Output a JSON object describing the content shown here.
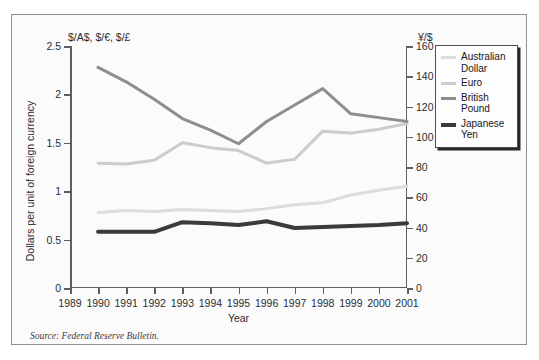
{
  "figure": {
    "left_axis_unit": "$/A$, $/€, $/£",
    "right_axis_unit": "¥/$",
    "y_axis_title": "Dollars per unit of foreign currency",
    "x_axis_title": "Year",
    "source_note": "Source: Federal Reserve Bulletin.",
    "frame_color": "#8d8f96",
    "axis_color": "#5d5f66"
  },
  "legend": {
    "position": "top-right",
    "items": [
      {
        "label": "Australian Dollar",
        "color": "#dcdcdc",
        "width": 3
      },
      {
        "label": "Euro",
        "color": "#cccccc",
        "width": 3
      },
      {
        "label": "British Pound",
        "color": "#8e8e8e",
        "width": 3
      },
      {
        "label": "Japanese Yen",
        "color": "#3a3a3a",
        "width": 4
      }
    ]
  },
  "chart_data": {
    "type": "line",
    "title": "",
    "subtitle": "",
    "xlabel": "Year",
    "ylabel": "Dollars per unit of foreign currency",
    "x": [
      1989,
      1990,
      1991,
      1992,
      1993,
      1994,
      1995,
      1996,
      1997,
      1998,
      1999,
      2000,
      2001
    ],
    "xtick_labels": [
      "1989",
      "1990",
      "1991",
      "1992",
      "1993",
      "1994",
      "1995",
      "1996",
      "1997",
      "1998",
      "1999",
      "2000",
      "2001"
    ],
    "xlim": [
      1989,
      2001
    ],
    "ylim": [
      0,
      2.5
    ],
    "ytick_labels": [
      "0",
      "0.5",
      "1",
      "1.5",
      "2",
      "2.5"
    ],
    "yticks": [
      0,
      0.5,
      1,
      1.5,
      2,
      2.5
    ],
    "y2lim": [
      0,
      160
    ],
    "y2ticks": [
      0,
      20,
      40,
      60,
      80,
      100,
      120,
      140,
      160
    ],
    "y2tick_labels": [
      "0",
      "20",
      "40",
      "60",
      "80",
      "100",
      "120",
      "140",
      "160"
    ],
    "grid": false,
    "legend_position": "top-right",
    "series": [
      {
        "name": "Australian Dollar",
        "axis": "left",
        "color": "#dcdcdc",
        "x": [
          1990,
          1991,
          1992,
          1993,
          1994,
          1995,
          1996,
          1997,
          1998,
          1999,
          2000,
          2001
        ],
        "values": [
          0.78,
          0.78,
          0.74,
          0.68,
          0.73,
          0.74,
          0.78,
          0.74,
          0.63,
          0.65,
          0.58,
          0.52
        ]
      },
      {
        "name": "Euro",
        "axis": "left",
        "color": "#cccccc",
        "x": [
          1990,
          1991,
          1992,
          1993,
          1994,
          1995,
          1996,
          1997,
          1998,
          1999,
          2000,
          2001
        ],
        "values": [
          1.29,
          1.29,
          1.32,
          1.5,
          1.43,
          1.42,
          1.29,
          1.29,
          1.44,
          1.61,
          1.57,
          1.5
        ]
      },
      {
        "name": "British Pound",
        "axis": "left",
        "color": "#8e8e8e",
        "x": [
          1990,
          1991,
          1992,
          1993,
          1994,
          1995,
          1996,
          1997,
          1998,
          1999,
          2000,
          2001
        ],
        "values": [
          2.28,
          2.13,
          1.95,
          1.75,
          1.63,
          1.49,
          1.72,
          1.89,
          2.06,
          1.8,
          1.76,
          1.72
        ]
      },
      {
        "name": "Japanese Yen",
        "axis": "right",
        "color": "#3a3a3a",
        "x": [
          1990,
          1991,
          1992,
          1993,
          1994,
          1995,
          1996,
          1997,
          1998,
          1999,
          2000,
          2001
        ],
        "values": [
          36.5,
          36.5,
          36.5,
          43.0,
          42.5,
          41.0,
          43.5,
          39.0,
          39.5,
          40.0,
          41.0,
          42.0
        ]
      }
    ],
    "series_left_rendered": [
      {
        "name": "Australian Dollar",
        "color": "#dcdcdc",
        "points": [
          [
            1990,
            0.78
          ],
          [
            1991,
            0.8
          ],
          [
            1992,
            0.79
          ],
          [
            1993,
            0.81
          ],
          [
            1994,
            0.8
          ],
          [
            1995,
            0.79
          ],
          [
            1996,
            0.82
          ],
          [
            1997,
            0.86
          ],
          [
            1998,
            0.88
          ],
          [
            1999,
            0.96
          ],
          [
            2000,
            1.01
          ],
          [
            2001,
            1.05
          ]
        ]
      },
      {
        "name": "Euro",
        "color": "#cccccc",
        "points": [
          [
            1990,
            1.29
          ],
          [
            1991,
            1.28
          ],
          [
            1992,
            1.32
          ],
          [
            1993,
            1.5
          ],
          [
            1994,
            1.45
          ],
          [
            1995,
            1.42
          ],
          [
            1996,
            1.29
          ],
          [
            1997,
            1.33
          ],
          [
            1998,
            1.62
          ],
          [
            1999,
            1.6
          ],
          [
            2000,
            1.64
          ],
          [
            2001,
            1.7
          ]
        ]
      },
      {
        "name": "British Pound",
        "color": "#8e8e8e",
        "points": [
          [
            1990,
            2.28
          ],
          [
            1991,
            2.13
          ],
          [
            1992,
            1.95
          ],
          [
            1993,
            1.75
          ],
          [
            1994,
            1.63
          ],
          [
            1995,
            1.49
          ],
          [
            1996,
            1.72
          ],
          [
            1997,
            1.89
          ],
          [
            1998,
            2.06
          ],
          [
            1999,
            1.8
          ],
          [
            2000,
            1.76
          ],
          [
            2001,
            1.72
          ]
        ]
      },
      {
        "name": "Japanese Yen",
        "color": "#3a3a3a",
        "points": [
          [
            1990,
            0.58
          ],
          [
            1991,
            0.58
          ],
          [
            1992,
            0.58
          ],
          [
            1993,
            0.68
          ],
          [
            1994,
            0.67
          ],
          [
            1995,
            0.65
          ],
          [
            1996,
            0.69
          ],
          [
            1997,
            0.62
          ],
          [
            1998,
            0.63
          ],
          [
            1999,
            0.64
          ],
          [
            2000,
            0.65
          ],
          [
            2001,
            0.67
          ]
        ]
      }
    ]
  }
}
